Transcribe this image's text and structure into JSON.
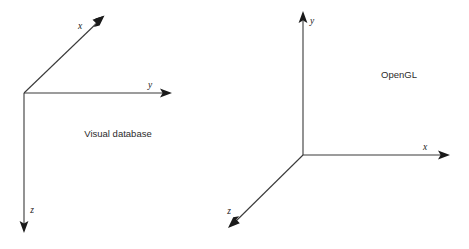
{
  "figure": {
    "background_color": "#ffffff",
    "line_color": "#3a3a3a",
    "arrow_color": "#1a1a1a",
    "text_color": "#1a1a1a"
  },
  "diagrams": [
    {
      "id": "visual-database",
      "caption": "Visual database",
      "caption_position": {
        "x": 118,
        "y": 137
      },
      "origin": {
        "x": 24,
        "y": 93
      },
      "axes": [
        {
          "name": "x",
          "label": "x",
          "label_position": {
            "x": 80,
            "y": 29
          },
          "from": {
            "x": 24,
            "y": 93
          },
          "to": {
            "x": 104,
            "y": 16
          },
          "direction": "up-right-diagonal"
        },
        {
          "name": "y",
          "label": "y",
          "label_position": {
            "x": 150,
            "y": 88
          },
          "from": {
            "x": 24,
            "y": 93
          },
          "to": {
            "x": 171,
            "y": 93
          },
          "direction": "right"
        },
        {
          "name": "z",
          "label": "z",
          "label_position": {
            "x": 32,
            "y": 213
          },
          "from": {
            "x": 24,
            "y": 93
          },
          "to": {
            "x": 24,
            "y": 232
          },
          "direction": "down"
        }
      ]
    },
    {
      "id": "opengl",
      "caption": "OpenGL",
      "caption_position": {
        "x": 399,
        "y": 78
      },
      "origin": {
        "x": 303,
        "y": 155
      },
      "axes": [
        {
          "name": "y",
          "label": "y",
          "label_position": {
            "x": 312,
            "y": 24
          },
          "from": {
            "x": 303,
            "y": 155
          },
          "to": {
            "x": 303,
            "y": 12
          },
          "direction": "up"
        },
        {
          "name": "x",
          "label": "x",
          "label_position": {
            "x": 425,
            "y": 150
          },
          "from": {
            "x": 303,
            "y": 155
          },
          "to": {
            "x": 450,
            "y": 155
          },
          "direction": "right"
        },
        {
          "name": "z",
          "label": "z",
          "label_position": {
            "x": 229,
            "y": 214
          },
          "from": {
            "x": 303,
            "y": 155
          },
          "to": {
            "x": 229,
            "y": 227
          },
          "direction": "down-left-diagonal"
        }
      ]
    }
  ]
}
